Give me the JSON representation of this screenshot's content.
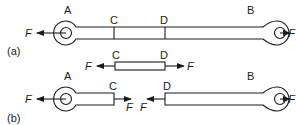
{
  "figure": {
    "panel_a": {
      "label": "(a)",
      "point_labels": {
        "A": "A",
        "B": "B",
        "C": "C",
        "D": "D"
      },
      "force_label": "F",
      "segment": {
        "left": "C",
        "right": "D",
        "force_label": "F"
      }
    },
    "panel_b": {
      "label": "(b)",
      "left_piece": {
        "end": "A",
        "cut": "C",
        "force_label": "F"
      },
      "right_piece": {
        "cut": "D",
        "end": "B",
        "force_label": "F"
      }
    },
    "colors": {
      "line": "#1a1a1a",
      "background": "#ffffff"
    }
  }
}
